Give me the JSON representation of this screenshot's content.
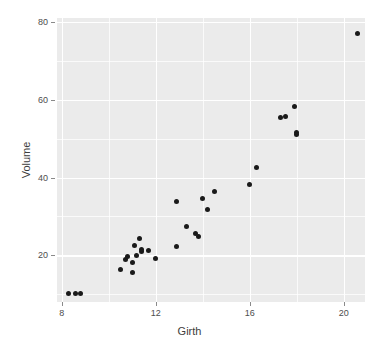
{
  "chart_data": {
    "type": "scatter",
    "title": "",
    "xlabel": "Girth",
    "ylabel": "Volume",
    "xlim": [
      7.8,
      20.9
    ],
    "ylim": [
      8.0,
      81.0
    ],
    "grid": true,
    "legend": null,
    "x_ticks": [
      8,
      12,
      16,
      20
    ],
    "y_ticks": [
      20,
      40,
      60,
      80
    ],
    "x_minor_ticks": [
      10,
      14,
      18
    ],
    "y_minor_ticks": [
      10,
      30,
      50,
      70
    ],
    "point_color": "#1a1a1a",
    "panel_color": "#ebebeb",
    "grid_color": "#ffffff",
    "points": [
      {
        "x": 8.3,
        "y": 10.3
      },
      {
        "x": 8.6,
        "y": 10.3
      },
      {
        "x": 8.8,
        "y": 10.2
      },
      {
        "x": 10.5,
        "y": 16.4
      },
      {
        "x": 10.7,
        "y": 18.8
      },
      {
        "x": 10.8,
        "y": 19.7
      },
      {
        "x": 11.0,
        "y": 15.6
      },
      {
        "x": 11.0,
        "y": 18.2
      },
      {
        "x": 11.1,
        "y": 22.6
      },
      {
        "x": 11.2,
        "y": 19.9
      },
      {
        "x": 11.3,
        "y": 24.2
      },
      {
        "x": 11.4,
        "y": 21.0
      },
      {
        "x": 11.4,
        "y": 21.4
      },
      {
        "x": 11.7,
        "y": 21.3
      },
      {
        "x": 12.0,
        "y": 19.1
      },
      {
        "x": 12.9,
        "y": 22.2
      },
      {
        "x": 12.9,
        "y": 33.8
      },
      {
        "x": 13.3,
        "y": 27.4
      },
      {
        "x": 13.7,
        "y": 25.7
      },
      {
        "x": 13.8,
        "y": 24.9
      },
      {
        "x": 14.0,
        "y": 34.5
      },
      {
        "x": 14.2,
        "y": 31.7
      },
      {
        "x": 14.5,
        "y": 36.3
      },
      {
        "x": 16.0,
        "y": 38.3
      },
      {
        "x": 16.3,
        "y": 42.6
      },
      {
        "x": 17.3,
        "y": 55.4
      },
      {
        "x": 17.5,
        "y": 55.7
      },
      {
        "x": 17.9,
        "y": 58.3
      },
      {
        "x": 18.0,
        "y": 51.5
      },
      {
        "x": 18.0,
        "y": 51.0
      },
      {
        "x": 20.6,
        "y": 77.0
      }
    ]
  }
}
